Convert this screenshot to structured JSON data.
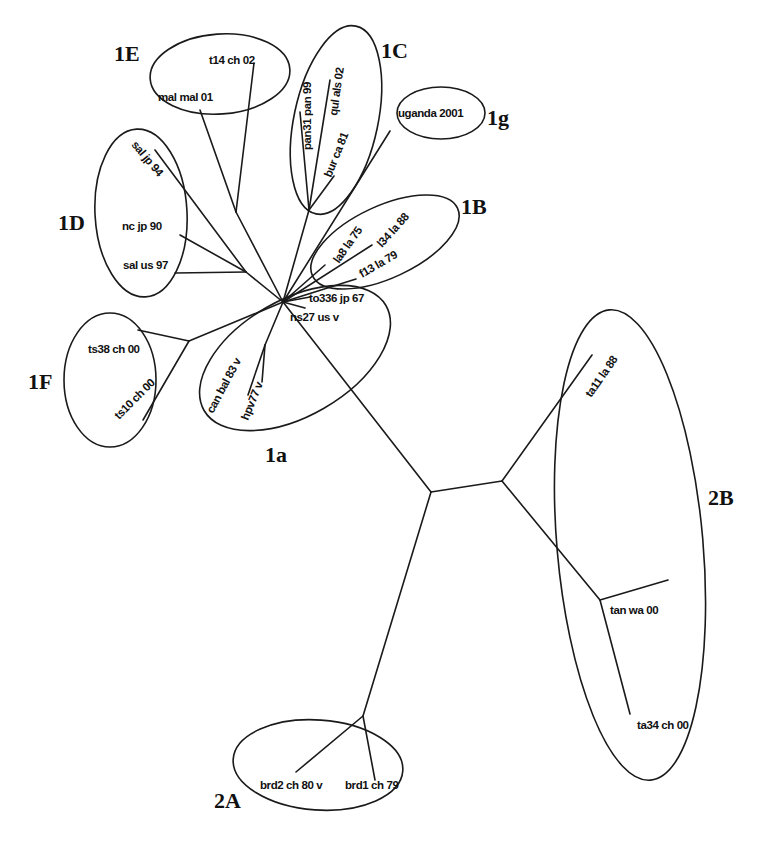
{
  "figure": {
    "type": "unrooted phylogenetic tree",
    "line_color": "#1a1a1a",
    "background": "#ffffff"
  },
  "clades": [
    {
      "id": "1E",
      "label": "1E",
      "members": [
        "t14 ch 02",
        "mal mal 01"
      ]
    },
    {
      "id": "1C",
      "label": "1C",
      "members": [
        "pan31 pan 99",
        "qul als 02",
        "bur ca 81"
      ]
    },
    {
      "id": "1g",
      "label": "1g",
      "members": [
        "uganda 2001"
      ]
    },
    {
      "id": "1D",
      "label": "1D",
      "members": [
        "sal jp 94",
        "nc jp 90",
        "sal us 97"
      ]
    },
    {
      "id": "1B",
      "label": "1B",
      "members": [
        "la8 la 75",
        "l34 la 88",
        "f13 la 79"
      ]
    },
    {
      "id": "1a",
      "label": "1a",
      "members": [
        "to336 jp 67",
        "ns27 us v",
        "can bal 83 v",
        "hpv77 v"
      ]
    },
    {
      "id": "1F",
      "label": "1F",
      "members": [
        "ts38 ch 00",
        "ts10 ch 00"
      ]
    },
    {
      "id": "2B",
      "label": "2B",
      "members": [
        "ta11 la 88",
        "tan wa 00",
        "ta34 ch 00"
      ]
    },
    {
      "id": "2A",
      "label": "2A",
      "members": [
        "brd2 ch 80 v",
        "brd1 ch 79"
      ]
    }
  ],
  "leaves": [
    {
      "id": "t14",
      "label": "t14 ch 02"
    },
    {
      "id": "mal",
      "label": "mal mal 01"
    },
    {
      "id": "pan31",
      "label": "pan31 pan 99"
    },
    {
      "id": "qul",
      "label": "qul als 02"
    },
    {
      "id": "bur",
      "label": "bur ca 81"
    },
    {
      "id": "uganda",
      "label": "uganda 2001"
    },
    {
      "id": "saljp",
      "label": "sal jp 94"
    },
    {
      "id": "ncjp",
      "label": "nc jp 90"
    },
    {
      "id": "salus",
      "label": "sal us 97"
    },
    {
      "id": "la8",
      "label": "la8 la 75"
    },
    {
      "id": "l34",
      "label": "l34 la 88"
    },
    {
      "id": "f13",
      "label": "f13 la 79"
    },
    {
      "id": "to336",
      "label": "to336 jp 67"
    },
    {
      "id": "ns27",
      "label": "ns27 us v"
    },
    {
      "id": "canbal",
      "label": "can bal 83 v"
    },
    {
      "id": "hpv77",
      "label": "hpv77 v"
    },
    {
      "id": "ts38",
      "label": "ts38 ch 00"
    },
    {
      "id": "ts10",
      "label": "ts10 ch 00"
    },
    {
      "id": "ta11",
      "label": "ta11 la 88"
    },
    {
      "id": "tanwa",
      "label": "tan wa 00"
    },
    {
      "id": "ta34",
      "label": "ta34 ch 00"
    },
    {
      "id": "brd2",
      "label": "brd2 ch 80 v"
    },
    {
      "id": "brd1",
      "label": "brd1 ch 79"
    }
  ]
}
